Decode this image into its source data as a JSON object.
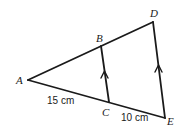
{
  "diagram": {
    "type": "similar-triangles",
    "points": {
      "A": {
        "label": "A",
        "x": 28,
        "y": 80
      },
      "B": {
        "label": "B",
        "x": 101,
        "y": 46
      },
      "C": {
        "label": "C",
        "x": 109,
        "y": 102
      },
      "D": {
        "label": "D",
        "x": 153,
        "y": 22
      },
      "E": {
        "label": "E",
        "x": 165,
        "y": 118
      }
    },
    "segments": [
      {
        "from": "A",
        "to": "D"
      },
      {
        "from": "A",
        "to": "E"
      },
      {
        "from": "B",
        "to": "C",
        "parallel_marker": true
      },
      {
        "from": "D",
        "to": "E",
        "parallel_marker": true
      }
    ],
    "lengths": {
      "AC": "15 cm",
      "CE": "10 cm"
    },
    "stroke_color": "#1a1a1a"
  }
}
